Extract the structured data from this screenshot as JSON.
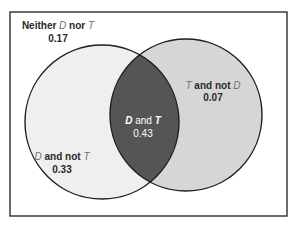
{
  "diagram": {
    "type": "venn",
    "sets": [
      "D",
      "T"
    ],
    "colors": {
      "frame": "#3a3a3a",
      "background": "#ffffff",
      "d_only_fill": "#efefef",
      "t_only_fill": "#d6d6d6",
      "intersection_fill": "#555555",
      "outline": "#1f1f1f",
      "dark_text": "#2a2a2a",
      "light_text": "#ffffff",
      "set_letter": "#707070"
    },
    "regions": {
      "neither": {
        "prefix": "Neither ",
        "set1": "D",
        "middle": " nor ",
        "set2": "T",
        "value": "0.17"
      },
      "t_not_d": {
        "set1": "T",
        "middle": " and not ",
        "set2": "D",
        "value": "0.07"
      },
      "d_and_t": {
        "set1": "D",
        "middle": " and ",
        "set2": "T",
        "value": "0.43"
      },
      "d_not_t": {
        "set1": "D",
        "middle": " and not ",
        "set2": "T",
        "value": "0.33"
      }
    }
  }
}
